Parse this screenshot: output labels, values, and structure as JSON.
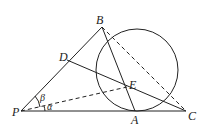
{
  "diagram": {
    "type": "geometry",
    "points": {
      "P": {
        "label": "P",
        "x": 21,
        "y": 111
      },
      "A": {
        "label": "A",
        "x": 135,
        "y": 111
      },
      "C": {
        "label": "C",
        "x": 186,
        "y": 111
      },
      "B": {
        "label": "B",
        "x": 102,
        "y": 27
      },
      "D": {
        "label": "D",
        "x": 67,
        "y": 60
      },
      "E": {
        "label": "E",
        "x": 127,
        "y": 87
      }
    },
    "circle": {
      "cx": 137,
      "cy": 70,
      "r": 41
    },
    "angles": {
      "alpha": "α",
      "beta": "β"
    },
    "colors": {
      "stroke": "#222222",
      "background": "#ffffff"
    }
  }
}
